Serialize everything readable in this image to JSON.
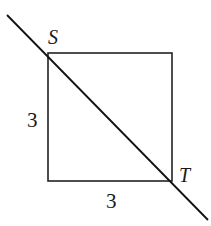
{
  "diagram": {
    "square": {
      "top_left": [
        48,
        53
      ],
      "top_right": [
        172,
        53
      ],
      "bottom_right": [
        172,
        181
      ],
      "bottom_left": [
        48,
        181
      ],
      "stroke_color": "#222222"
    },
    "diagonal_line": {
      "start": [
        7,
        15
      ],
      "end": [
        208,
        220
      ],
      "stroke_color": "#111111"
    },
    "points": [
      {
        "name": "S",
        "label": "S",
        "x": 48,
        "y": 53
      },
      {
        "name": "T",
        "label": "T",
        "x": 172,
        "y": 181
      }
    ],
    "side_labels": {
      "left": "3",
      "bottom": "3"
    }
  }
}
